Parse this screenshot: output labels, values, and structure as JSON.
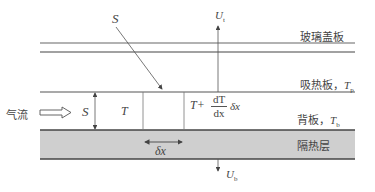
{
  "diagram": {
    "type": "flat-plate solar air heater cross-section",
    "colors": {
      "line": "#555555",
      "insulation_fill": "#cfcfcf",
      "text": "#444444"
    },
    "layers": {
      "glass_cover": "玻璃盖板",
      "absorber_plate": "吸热板，",
      "absorber_symbol": "T",
      "absorber_sub": "p",
      "back_plate": "背板，",
      "back_symbol": "T",
      "back_sub": "b",
      "insulation": "隔热层"
    },
    "labels": {
      "solar_radiation": "S",
      "top_loss": "U",
      "top_loss_sub": "t",
      "bottom_loss": "U",
      "bottom_loss_sub": "b",
      "airflow": "气流",
      "gap": "S",
      "temp_in": "T",
      "temp_out_prefix": "T+",
      "deriv_num": "dT",
      "deriv_den": "dx",
      "deriv_suffix": "δx",
      "element": "δx"
    }
  }
}
